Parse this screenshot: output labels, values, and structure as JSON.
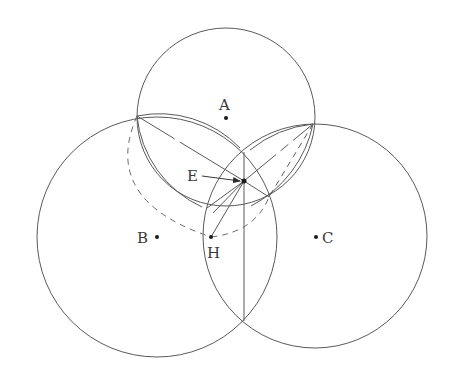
{
  "diagram": {
    "type": "geometric-construction",
    "stroke_color": "#5a5a5a",
    "background": "#ffffff",
    "circles": [
      {
        "name": "A",
        "cx": 226,
        "cy": 117,
        "r": 89
      },
      {
        "name": "B",
        "cx": 157,
        "cy": 237,
        "r": 120
      },
      {
        "name": "C",
        "cx": 315,
        "cy": 236,
        "r": 112
      }
    ],
    "points": {
      "A": {
        "x": 226,
        "y": 118,
        "label": "A",
        "lx": 219,
        "ly": 110
      },
      "B": {
        "x": 157,
        "y": 237,
        "label": "B",
        "lx": 137,
        "ly": 243
      },
      "C": {
        "x": 316,
        "y": 237,
        "label": "C",
        "lx": 322,
        "ly": 243
      },
      "E": {
        "x": 244,
        "y": 181,
        "label": "E",
        "lx": 187,
        "ly": 181
      },
      "H": {
        "x": 211,
        "y": 237,
        "label": "H",
        "lx": 207,
        "ly": 258
      }
    },
    "vertices": {
      "P1": {
        "x": 137,
        "y": 116
      },
      "P2": {
        "x": 313,
        "y": 124
      },
      "P3": {
        "x": 244,
        "y": 152
      },
      "P4": {
        "x": 269,
        "y": 197
      },
      "P5": {
        "x": 244,
        "y": 321
      },
      "P6": {
        "x": 202,
        "y": 207
      },
      "P7": {
        "x": 251,
        "y": 206
      }
    },
    "labels": {
      "A": "A",
      "B": "B",
      "C": "C",
      "E": "E",
      "H": "H"
    }
  }
}
